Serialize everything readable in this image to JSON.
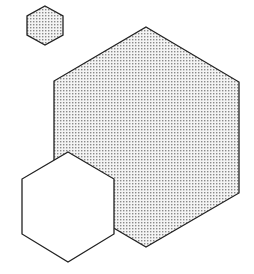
{
  "diagram": {
    "colors": {
      "background": "#ffffff",
      "stroke": "#222222",
      "dot": "#8a8a8a",
      "dot_fill_bg": "#f4f4f4",
      "plain_fill": "#ffffff"
    },
    "shapes": [
      {
        "name": "small-dotted-hexagon",
        "fill": "dotted",
        "points": "45,6 63,16 63,35 45,45 27,35 27,16"
      },
      {
        "name": "large-dotted-hexagon",
        "fill": "dotted",
        "points": "146,27 239,82 239,193 146,247 54,193 54,81"
      },
      {
        "name": "white-hexagon",
        "fill": "plain",
        "points": "68,152 114,179 114,234 68,262 22,234 22,179"
      }
    ]
  }
}
